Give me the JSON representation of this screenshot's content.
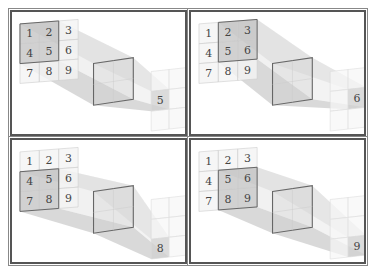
{
  "diagram": {
    "input_grid": [
      "1",
      "2",
      "3",
      "4",
      "5",
      "6",
      "7",
      "8",
      "9"
    ],
    "panels": [
      {
        "id": "top-left",
        "window_cells": [
          "1",
          "2",
          "4",
          "5"
        ],
        "window_origin": [
          0,
          0
        ],
        "output_label": "5",
        "output_cell": [
          0,
          1
        ]
      },
      {
        "id": "top-right",
        "window_cells": [
          "2",
          "3",
          "5",
          "6"
        ],
        "window_origin": [
          1,
          0
        ],
        "output_label": "6",
        "output_cell": [
          1,
          1
        ]
      },
      {
        "id": "bottom-left",
        "window_cells": [
          "4",
          "5",
          "7",
          "8"
        ],
        "window_origin": [
          0,
          1
        ],
        "output_label": "8",
        "output_cell": [
          0,
          2
        ]
      },
      {
        "id": "bottom-right",
        "window_cells": [
          "5",
          "6",
          "8",
          "9"
        ],
        "window_origin": [
          1,
          1
        ],
        "output_label": "9",
        "output_cell": [
          1,
          2
        ]
      }
    ],
    "colors": {
      "frame": "#555555",
      "grid_line": "#cccccc",
      "window_fill": "#bdbdbd",
      "window_stroke": "#666666",
      "beam_fill": "#d6d6d6",
      "text": "#444444"
    }
  }
}
